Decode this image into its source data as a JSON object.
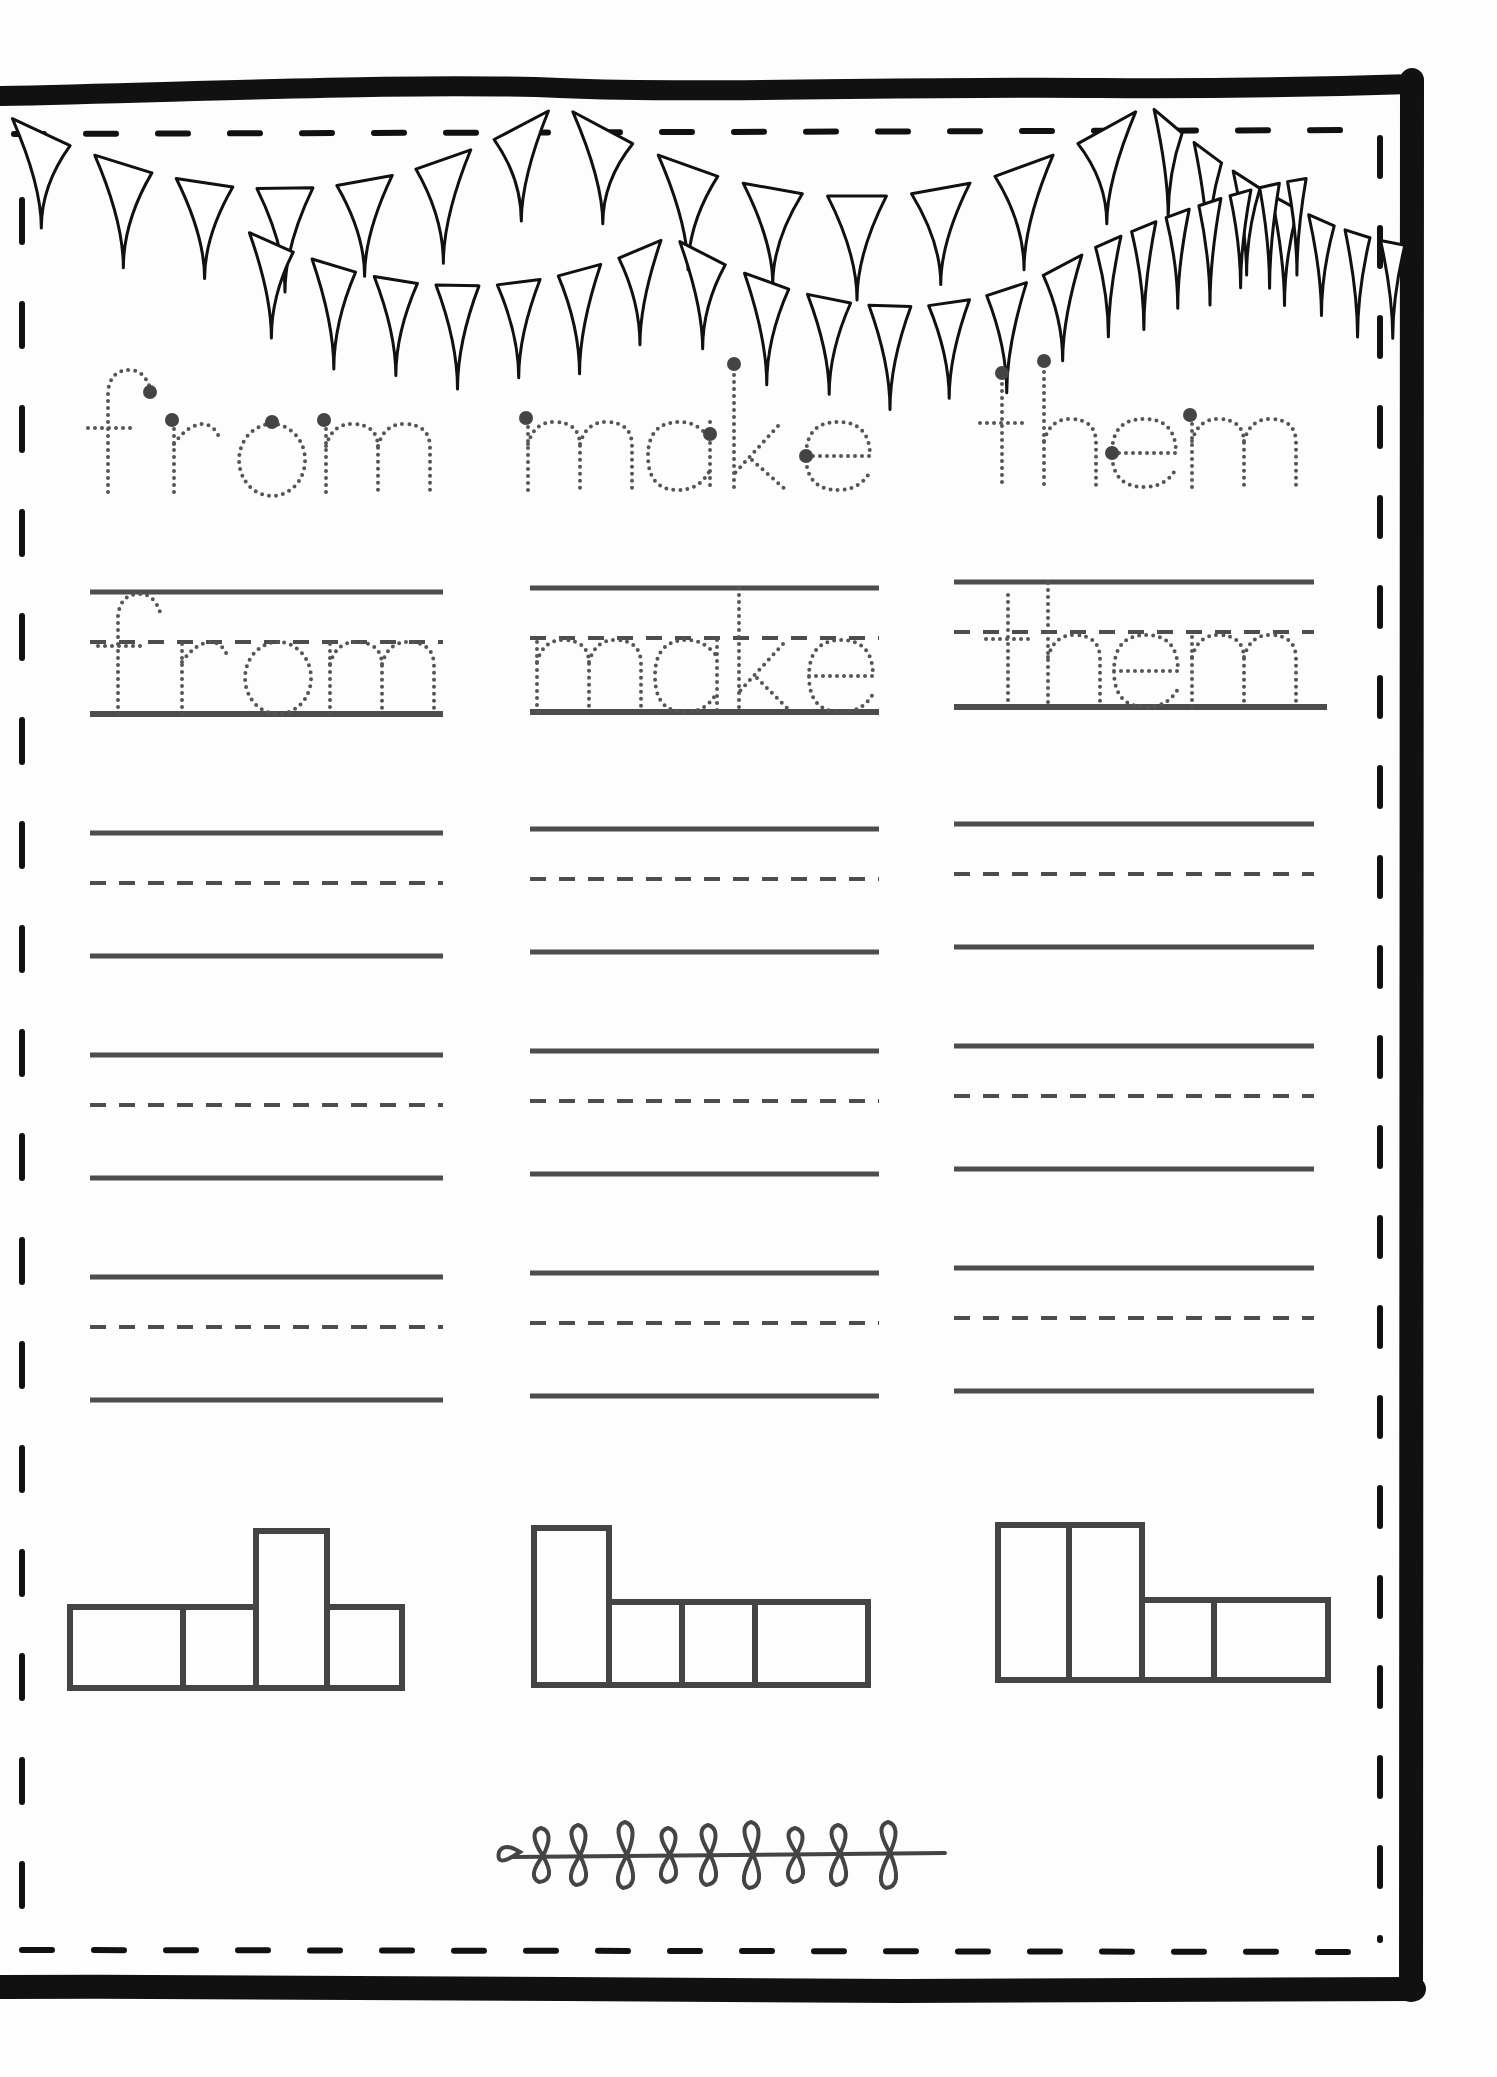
{
  "worksheet": {
    "title": "Sight word practice",
    "words": [
      "from",
      "make",
      "them"
    ],
    "colors": {
      "border": "#111111",
      "lines": "#4d4d4d",
      "trace_dots": "#555555",
      "start_dots": "#444444",
      "boxes": "#444444",
      "paper": "#fdfdfd"
    },
    "sections": {
      "trace_row_1": {
        "label": "Trace the word",
        "words": [
          "from",
          "make",
          "them"
        ]
      },
      "trace_row_2": {
        "label": "Trace on the lines",
        "words": [
          "from",
          "make",
          "them"
        ]
      },
      "write_rows": {
        "label": "Write the word",
        "count_per_column": 3
      },
      "word_shapes": {
        "label": "Word shape boxes",
        "items": [
          {
            "word": "from",
            "shape": [
              "short",
              "short",
              "tall",
              "short"
            ]
          },
          {
            "word": "make",
            "shape": [
              "tall",
              "short",
              "short",
              "short"
            ]
          },
          {
            "word": "them",
            "shape": [
              "tall",
              "tall",
              "short",
              "short"
            ]
          }
        ]
      }
    },
    "decorations": {
      "top": "bunting-banner",
      "bottom": "leaf-sprig"
    }
  }
}
